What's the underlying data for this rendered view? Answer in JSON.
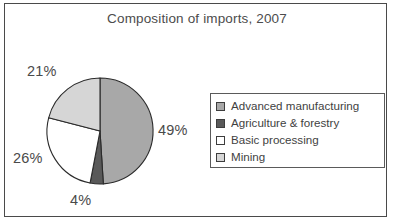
{
  "figure": {
    "title": "Composition of imports, 2007",
    "border_color": "#4a4a4a",
    "background": "#ffffff"
  },
  "chart_data": {
    "type": "pie",
    "title": "Composition of imports, 2007",
    "xlabel": "",
    "ylabel": "",
    "start_angle_clock": "12 o'clock",
    "direction": "clockwise",
    "grid": false,
    "legend_position": "right",
    "categories": [
      "Advanced manufacturing",
      "Agriculture & forestry",
      "Basic processing",
      "Mining"
    ],
    "values": [
      49,
      4,
      26,
      21
    ],
    "value_labels": [
      "49%",
      "4%",
      "26%",
      "21%"
    ],
    "unit": "%",
    "total": 100,
    "colors": [
      "#a8a8a8",
      "#595959",
      "#ffffff",
      "#d6d6d6"
    ],
    "slice_outline_color": "#2b2b2b",
    "slices": [
      {
        "label": "Advanced manufacturing",
        "value": 49,
        "display": "49%",
        "color": "#a8a8a8"
      },
      {
        "label": "Agriculture & forestry",
        "value": 4,
        "display": "4%",
        "color": "#595959"
      },
      {
        "label": "Basic processing",
        "value": 26,
        "display": "26%",
        "color": "#ffffff"
      },
      {
        "label": "Mining",
        "value": 21,
        "display": "21%",
        "color": "#d6d6d6"
      }
    ]
  },
  "legend": {
    "items": [
      {
        "label": "Advanced manufacturing",
        "color": "#a8a8a8"
      },
      {
        "label": "Agriculture & forestry",
        "color": "#595959"
      },
      {
        "label": "Basic processing",
        "color": "#ffffff"
      },
      {
        "label": "Mining",
        "color": "#d6d6d6"
      }
    ]
  }
}
